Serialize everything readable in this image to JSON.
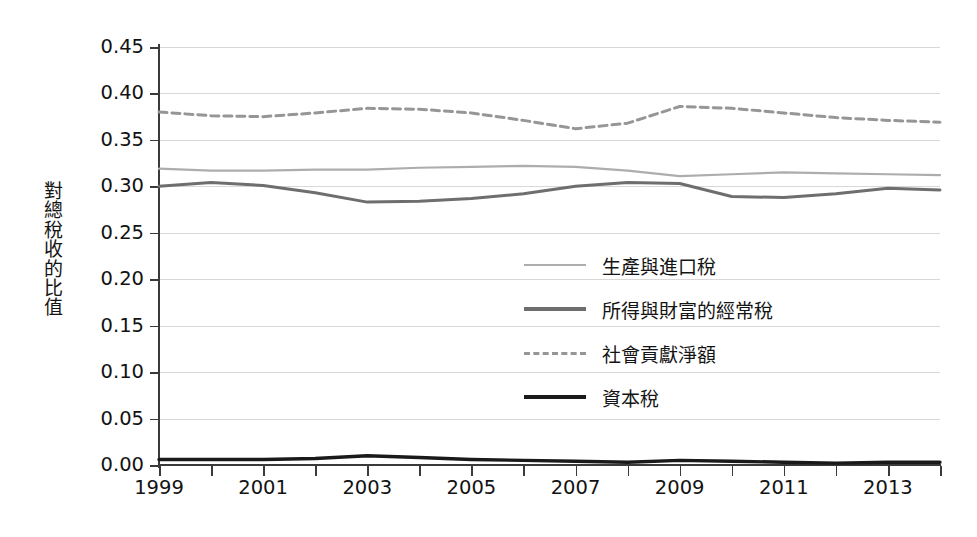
{
  "chart_data": {
    "type": "line",
    "title": "",
    "xlabel": "",
    "ylabel": "對總稅收的比值",
    "xlim": [
      1999,
      2014
    ],
    "ylim": [
      0.0,
      0.45
    ],
    "grid": true,
    "legend_position": "center",
    "x": [
      1999,
      2000,
      2001,
      2002,
      2003,
      2004,
      2005,
      2006,
      2007,
      2008,
      2009,
      2010,
      2011,
      2012,
      2013,
      2014
    ],
    "y_ticks": [
      "0.00",
      "0.05",
      "0.10",
      "0.15",
      "0.20",
      "0.25",
      "0.30",
      "0.35",
      "0.40",
      "0.45"
    ],
    "y_tick_values": [
      0.0,
      0.05,
      0.1,
      0.15,
      0.2,
      0.25,
      0.3,
      0.35,
      0.4,
      0.45
    ],
    "x_tick_values": [
      1999,
      2000,
      2001,
      2002,
      2003,
      2004,
      2005,
      2006,
      2007,
      2008,
      2009,
      2010,
      2011,
      2012,
      2013,
      2014
    ],
    "x_tick_labels": [
      "1999",
      "",
      "2001",
      "",
      "2003",
      "",
      "2005",
      "",
      "2007",
      "",
      "2009",
      "",
      "2011",
      "",
      "2013",
      ""
    ],
    "series": [
      {
        "name": "生產與進口稅",
        "color": "#adadad",
        "style": "solid",
        "width": 2.2,
        "values": [
          0.319,
          0.317,
          0.317,
          0.318,
          0.318,
          0.32,
          0.321,
          0.322,
          0.321,
          0.317,
          0.311,
          0.313,
          0.315,
          0.314,
          0.313,
          0.312
        ]
      },
      {
        "name": "所得與財富的經常稅",
        "color": "#6e6e6e",
        "style": "solid",
        "width": 3.0,
        "values": [
          0.3,
          0.304,
          0.301,
          0.293,
          0.283,
          0.284,
          0.287,
          0.292,
          0.3,
          0.304,
          0.303,
          0.289,
          0.288,
          0.292,
          0.298,
          0.296
        ]
      },
      {
        "name": "社會貢獻淨額",
        "color": "#969696",
        "style": "dashed",
        "width": 3.0,
        "values": [
          0.38,
          0.376,
          0.375,
          0.379,
          0.384,
          0.383,
          0.379,
          0.371,
          0.362,
          0.368,
          0.386,
          0.384,
          0.379,
          0.374,
          0.371,
          0.369
        ]
      },
      {
        "name": "資本稅",
        "color": "#1a1a1a",
        "style": "solid",
        "width": 3.4,
        "values": [
          0.006,
          0.006,
          0.006,
          0.007,
          0.01,
          0.008,
          0.006,
          0.005,
          0.004,
          0.003,
          0.005,
          0.004,
          0.003,
          0.002,
          0.003,
          0.003
        ]
      }
    ]
  },
  "y_axis_title_chars": [
    "對",
    "總",
    "稅",
    "收",
    "的",
    "比",
    "值"
  ],
  "legend": {
    "items": [
      {
        "label": "生產與進口稅",
        "color": "#adadad",
        "style": "solid",
        "thickness": 2.4
      },
      {
        "label": "所得與財富的經常稅",
        "color": "#6e6e6e",
        "style": "solid",
        "thickness": 3.4
      },
      {
        "label": "社會貢獻淨額",
        "color": "#969696",
        "style": "dashed",
        "thickness": 3.0
      },
      {
        "label": "資本稅",
        "color": "#1a1a1a",
        "style": "solid",
        "thickness": 4.0
      }
    ]
  },
  "colors": {
    "axis": "#3a3a3a",
    "gridline": "#d8d8d8",
    "background": "#ffffff",
    "text": "#121212"
  }
}
